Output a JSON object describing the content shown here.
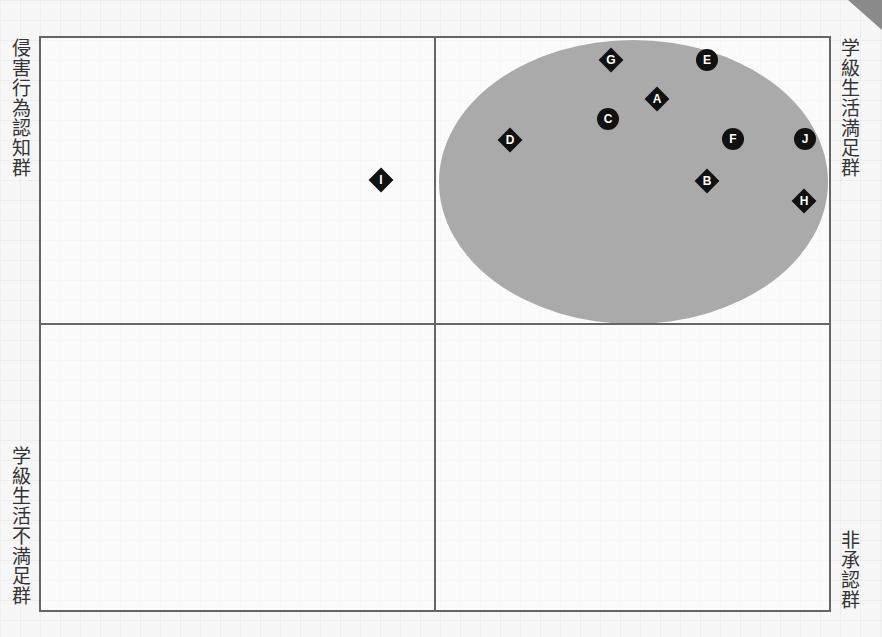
{
  "labels": {
    "top_left": "侵害行為認知群",
    "top_right": "学級生活満足群",
    "bottom_left": "学級生活不満足群",
    "bottom_right": "非承認群"
  },
  "colors": {
    "frame": "#666666",
    "ellipse": "#aaaaaa",
    "marker": "#111111",
    "background": "#f7f7f7"
  },
  "chart_data": {
    "type": "scatter",
    "title": "",
    "quadrants": {
      "top_left": "侵害行為認知群",
      "top_right": "学級生活満足群",
      "bottom_left": "学級生活不満足群",
      "bottom_right": "非承認群"
    },
    "axes": {
      "x_range": [
        -1,
        1
      ],
      "y_range": [
        -1,
        1
      ],
      "grid": false
    },
    "highlight_region": {
      "shape": "ellipse",
      "quadrant": "top_right",
      "color": "#aaaaaa"
    },
    "points": [
      {
        "label": "A",
        "marker": "diamond",
        "x": 0.56,
        "y": 0.79,
        "px": 657,
        "py": 99
      },
      {
        "label": "B",
        "marker": "diamond",
        "x": 0.69,
        "y": 0.5,
        "px": 707,
        "py": 181
      },
      {
        "label": "C",
        "marker": "circle",
        "x": 0.44,
        "y": 0.72,
        "px": 608,
        "py": 119
      },
      {
        "label": "D",
        "marker": "diamond",
        "x": 0.19,
        "y": 0.64,
        "px": 510,
        "py": 140
      },
      {
        "label": "E",
        "marker": "circle",
        "x": 0.69,
        "y": 0.92,
        "px": 707,
        "py": 60
      },
      {
        "label": "F",
        "marker": "circle",
        "x": 0.76,
        "y": 0.64,
        "px": 733,
        "py": 139
      },
      {
        "label": "G",
        "marker": "diamond",
        "x": 0.45,
        "y": 0.92,
        "px": 611,
        "py": 60
      },
      {
        "label": "H",
        "marker": "diamond",
        "x": 0.94,
        "y": 0.43,
        "px": 804,
        "py": 201
      },
      {
        "label": "I",
        "marker": "diamond",
        "x": -0.14,
        "y": 0.5,
        "px": 381,
        "py": 180
      },
      {
        "label": "J",
        "marker": "circle",
        "x": 0.94,
        "y": 0.64,
        "px": 805,
        "py": 139
      }
    ]
  }
}
